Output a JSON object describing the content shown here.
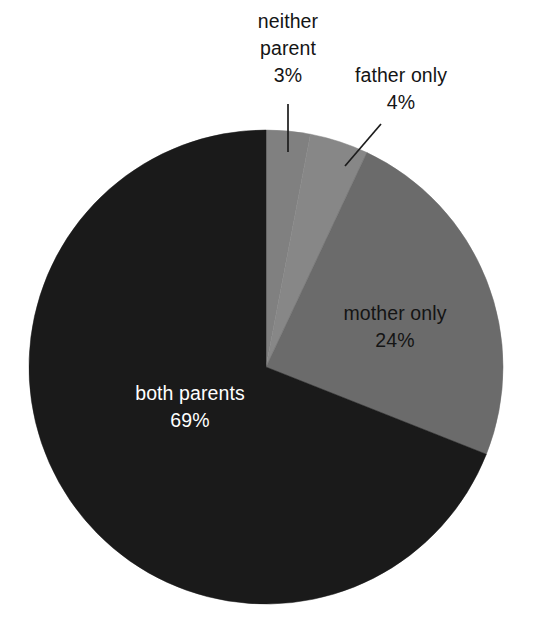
{
  "chart_data": {
    "type": "pie",
    "title": "",
    "subtitle": "",
    "xlabel": "",
    "ylabel": "",
    "legend_position": "none",
    "grid": false,
    "labels_inside": true,
    "start_angle_deg": 0,
    "direction": "clockwise",
    "categories": [
      "neither parent",
      "father only",
      "mother only",
      "both parents"
    ],
    "values": [
      3,
      4,
      24,
      69
    ],
    "value_unit": "%",
    "slices": [
      {
        "label": "neither parent",
        "label_line1": "neither",
        "label_line2": "parent",
        "value": 3,
        "value_text": "3%",
        "color": "#808080",
        "label_placement": "outside",
        "text_color": "#141414"
      },
      {
        "label": "father only",
        "label_line1": "father only",
        "label_line2": "",
        "value": 4,
        "value_text": "4%",
        "color": "#878787",
        "label_placement": "outside",
        "text_color": "#141414"
      },
      {
        "label": "mother only",
        "label_line1": "mother only",
        "label_line2": "",
        "value": 24,
        "value_text": "24%",
        "color": "#6b6b6b",
        "label_placement": "inside",
        "text_color": "#141414"
      },
      {
        "label": "both parents",
        "label_line1": "both parents",
        "label_line2": "",
        "value": 69,
        "value_text": "69%",
        "color": "#1a1a1a",
        "label_placement": "inside",
        "text_color": "#ffffff"
      }
    ]
  },
  "geometry": {
    "center_x": 266,
    "center_y": 367,
    "radius": 237
  },
  "colors": {
    "background": "#ffffff",
    "both_parents": "#1a1a1a",
    "mother_only": "#6b6b6b",
    "father_only": "#878787",
    "neither_parent": "#808080",
    "leader_line": "#1c1c1c",
    "dark_text": "#141414",
    "light_text": "#ffffff"
  }
}
